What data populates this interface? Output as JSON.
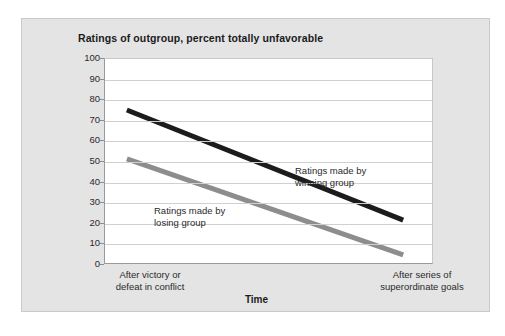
{
  "figure": {
    "title": "Ratings of outgroup, percent totally unfavorable",
    "background_color": "#e4e4e4",
    "plot_background_color": "#ffffff"
  },
  "chart_data": {
    "type": "line",
    "title": "Ratings of outgroup, percent totally unfavorable",
    "xlabel": "Time",
    "ylabel": "",
    "ylim": [
      0,
      100
    ],
    "yticks": [
      0,
      10,
      20,
      30,
      40,
      50,
      60,
      70,
      80,
      90,
      100
    ],
    "ytick_labels": [
      "0",
      "10",
      "20",
      "30",
      "40",
      "50",
      "60",
      "70",
      "80",
      "90",
      "100"
    ],
    "grid": true,
    "grid_axis": "y",
    "legend": "inline-annotations",
    "categories": [
      "After victory or defeat in conflict",
      "After series of superordinate goals"
    ],
    "xtick_labels": [
      [
        "After victory or",
        "defeat in conflict"
      ],
      [
        "After series of",
        "superordinate goals"
      ]
    ],
    "series": [
      {
        "name": "Ratings made by winning group",
        "color": "#1c1c1c",
        "values": [
          75,
          21
        ],
        "linewidth": 5,
        "annotation": [
          "Ratings made by",
          "winning group"
        ]
      },
      {
        "name": "Ratings made by losing group",
        "color": "#8d8d8d",
        "values": [
          51,
          4
        ],
        "linewidth": 5,
        "annotation": [
          "Ratings made by",
          "losing group"
        ]
      }
    ]
  },
  "annotations": {
    "winning": {
      "line1": "Ratings made by",
      "line2": "winning group"
    },
    "losing": {
      "line1": "Ratings made by",
      "line2": "losing group"
    }
  },
  "axes": {
    "x_title": "Time",
    "x_left_line1": "After victory or",
    "x_left_line2": "defeat in conflict",
    "x_right_line1": "After series of",
    "x_right_line2": "superordinate goals",
    "y_labels": [
      "100",
      "90",
      "80",
      "70",
      "60",
      "50",
      "40",
      "30",
      "20",
      "10",
      "0"
    ]
  }
}
